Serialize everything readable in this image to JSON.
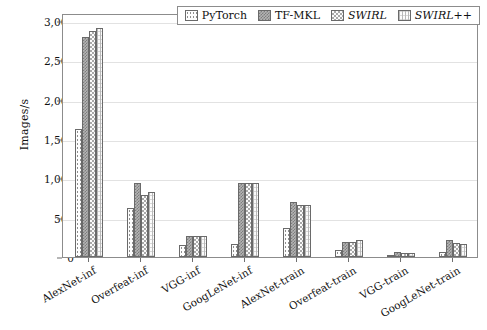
{
  "chart_data": {
    "type": "bar",
    "title": "",
    "xlabel": "",
    "ylabel": "Images/s",
    "ylim": [
      0,
      3100
    ],
    "yticks": [
      0,
      500,
      1000,
      1500,
      2000,
      2500,
      3000
    ],
    "ytick_labels": [
      "0",
      "500",
      "1,000",
      "1,500",
      "2,000",
      "2,500",
      "3,000"
    ],
    "grid": true,
    "legend_position": "top-right",
    "categories": [
      "AlexNet-inf",
      "Overfeat-inf",
      "VGG-inf",
      "GoogLeNet-inf",
      "AlexNet-train",
      "Overfeat-train",
      "VGG-train",
      "GoogLeNet-train"
    ],
    "series": [
      {
        "name": "PyTorch",
        "italic": false,
        "pattern": "dots",
        "color": "#fdfdfd",
        "values": [
          1630,
          620,
          150,
          160,
          370,
          95,
          30,
          60
        ]
      },
      {
        "name": "TF-MKL",
        "italic": false,
        "pattern": "crosshatch",
        "color": "#b4b4b4",
        "values": [
          2800,
          940,
          265,
          935,
          700,
          185,
          60,
          210
        ]
      },
      {
        "name": "SWIRL",
        "italic": true,
        "pattern": "checker",
        "color": "#fbfbfb",
        "values": [
          2870,
          790,
          265,
          935,
          660,
          190,
          50,
          175
        ]
      },
      {
        "name": "SWIRL++",
        "italic": true,
        "pattern": "vertical-lines",
        "color": "#fcfcfc",
        "values": [
          2905,
          820,
          265,
          935,
          660,
          220,
          50,
          165
        ]
      }
    ]
  }
}
